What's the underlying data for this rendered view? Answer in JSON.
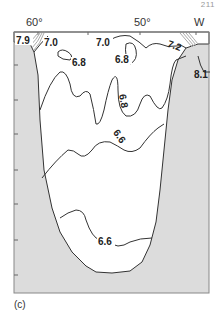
{
  "page_number": "211",
  "figure": {
    "panel_label": "(c)",
    "type": "contour map",
    "axis": {
      "top_labels": [
        {
          "text": "60°",
          "x": 26
        },
        {
          "text": "50°",
          "x": 134
        },
        {
          "text": "W",
          "x": 196
        }
      ]
    },
    "colors": {
      "land": "#dcdcdc",
      "water": "#ffffff",
      "contour": "#333333",
      "frame": "#888888"
    },
    "contour_labels": [
      {
        "text": "7.9",
        "x": 16,
        "y": 43,
        "rotate": 0
      },
      {
        "text": "7.0",
        "x": 44,
        "y": 45,
        "rotate": 0
      },
      {
        "text": "7.0",
        "x": 96,
        "y": 45,
        "rotate": 0
      },
      {
        "text": "7.2",
        "x": 168,
        "y": 47,
        "rotate": 20
      },
      {
        "text": "6.8",
        "x": 72,
        "y": 64,
        "rotate": 0
      },
      {
        "text": "6.8",
        "x": 116,
        "y": 62,
        "rotate": 0
      },
      {
        "text": "8.1",
        "x": 194,
        "y": 76,
        "rotate": 0
      },
      {
        "text": "6.8",
        "x": 122,
        "y": 104,
        "rotate": 80
      },
      {
        "text": "6.6",
        "x": 116,
        "y": 138,
        "rotate": 60
      },
      {
        "text": "6.6",
        "x": 98,
        "y": 244,
        "rotate": 0
      }
    ]
  }
}
